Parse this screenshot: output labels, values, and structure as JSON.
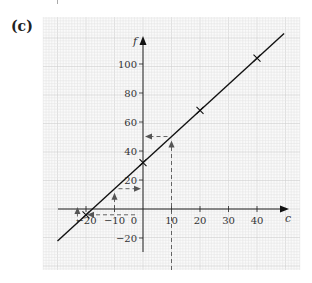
{
  "panel_label": "(c)",
  "chart_data": {
    "type": "line",
    "title": "",
    "xlabel": "c",
    "ylabel": "f",
    "x_ticks": [
      -20,
      -10,
      0,
      10,
      20,
      30,
      40
    ],
    "x_tick_labels": [
      "−20",
      "−10",
      "0",
      "10",
      "20",
      "30",
      "40"
    ],
    "y_ticks": [
      -20,
      20,
      40,
      60,
      80,
      100
    ],
    "y_tick_labels": [
      "−20",
      "20",
      "40",
      "60",
      "80",
      "100"
    ],
    "xlim": [
      -30,
      50
    ],
    "ylim": [
      -22,
      122
    ],
    "grid": true,
    "series": [
      {
        "name": "f = 1.8c + 32",
        "line": {
          "x": [
            -30,
            49.5
          ],
          "y": [
            -22,
            121.1
          ]
        },
        "markers": {
          "x": [
            -20,
            0,
            20,
            40
          ],
          "y": [
            -4,
            32,
            68,
            104
          ],
          "marker": "x"
        }
      }
    ],
    "annotations": [
      {
        "type": "dashed-arrow-path",
        "from_c": 10,
        "to_f": 50,
        "direction": "up-then-left"
      },
      {
        "type": "dashed-arrow-path",
        "from_c": -10,
        "to_f": 14,
        "direction": "up-then-right"
      },
      {
        "type": "dashed-arrow-path",
        "from_f": -4,
        "to_c": -20,
        "direction": "left"
      }
    ]
  },
  "colors": {
    "grid_minor": "#e6e6e6",
    "grid_major": "#cfcfcf",
    "line": "#111111",
    "dashed": "#555555"
  }
}
